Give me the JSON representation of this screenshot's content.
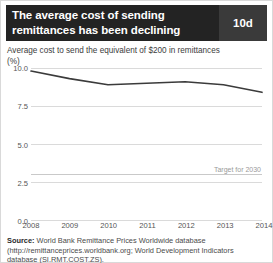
{
  "header": {
    "title_line1": "The average cost of sending",
    "title_line2": "remittances has been declining",
    "badge": "10d",
    "badge_color": "#3a3a3a",
    "background_color": "#232323"
  },
  "subtitle": "Average cost to send the equivalent of $200 in remittances",
  "axis_unit": "(%)",
  "source": {
    "label": "Source:",
    "text": "World Bank Remittance Prices Worldwide database (http://remittanceprices.worldbank.org; World Development Indicators database (SI.RMT.COST.ZS)."
  },
  "chart_data": {
    "type": "line",
    "title": "Average cost to send the equivalent of $200 in remittances",
    "xlabel": "",
    "ylabel": "(%)",
    "ylim": [
      0,
      10
    ],
    "yticks": [
      "0.0",
      "2.5",
      "5.0",
      "7.5",
      "10.0"
    ],
    "ytick_values": [
      0,
      2.5,
      5,
      7.5,
      10
    ],
    "grid": true,
    "legend": "none",
    "line_color": "#3b3b3b",
    "categories": [
      "2008",
      "2009",
      "2010",
      "2011",
      "2012",
      "2013",
      "2014"
    ],
    "x": [
      2008,
      2009,
      2010,
      2011,
      2012,
      2013,
      2014
    ],
    "values": [
      9.8,
      9.3,
      8.9,
      9.0,
      9.1,
      8.9,
      8.4
    ],
    "series": [
      {
        "name": "Average cost (%)",
        "values": [
          9.8,
          9.3,
          8.9,
          9.0,
          9.1,
          8.9,
          8.4
        ]
      }
    ],
    "annotations": [
      {
        "name": "target-2030",
        "label": "Target for 2030",
        "value": 3.0,
        "color": "#c9c9c9"
      }
    ]
  }
}
